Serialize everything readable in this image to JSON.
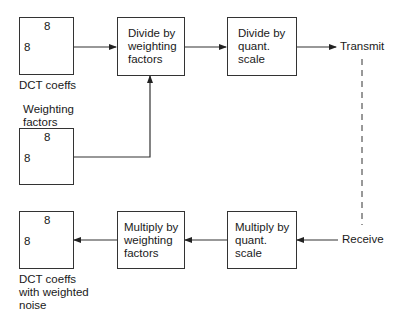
{
  "encoder": {
    "input_matrix": {
      "cols": "8",
      "rows": "8",
      "caption": "DCT coeffs"
    },
    "weighting_matrix": {
      "cols": "8",
      "rows": "8",
      "caption_lines": [
        "Weighting",
        "factors"
      ]
    },
    "divide_weighting": {
      "lines": [
        "Divide by",
        "weighting",
        "factors"
      ]
    },
    "divide_quant": {
      "lines": [
        "Divide by",
        "quant.",
        "scale"
      ]
    },
    "output_label": "Transmit"
  },
  "decoder": {
    "input_label": "Receive",
    "multiply_quant": {
      "lines": [
        "Multiply by",
        "quant.",
        "scale"
      ]
    },
    "multiply_weighting": {
      "lines": [
        "Multiply by",
        "weighting",
        "factors"
      ]
    },
    "output_matrix": {
      "cols": "8",
      "rows": "8",
      "caption_lines": [
        "DCT coeffs",
        "with weighted",
        "noise"
      ]
    }
  }
}
